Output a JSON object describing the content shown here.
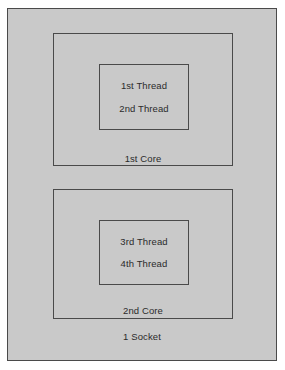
{
  "diagram": {
    "type": "nested-boxes",
    "colors": {
      "background": "#c9c9c9",
      "page_background": "#ffffff",
      "border": "#4a4a4a",
      "text": "#2b2b2b"
    },
    "socket": {
      "label": "1 Socket",
      "cores": [
        {
          "label": "1st Core",
          "threads": [
            {
              "label": "1st Thread"
            },
            {
              "label": "2nd Thread"
            }
          ]
        },
        {
          "label": "2nd Core",
          "threads": [
            {
              "label": "3rd Thread"
            },
            {
              "label": "4th Thread"
            }
          ]
        }
      ]
    }
  }
}
